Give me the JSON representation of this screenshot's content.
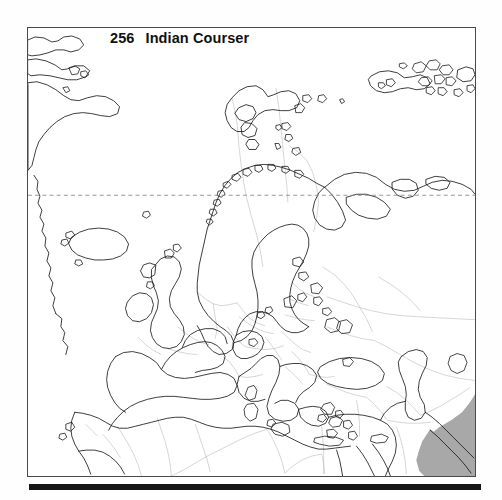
{
  "page": {
    "background_color": "#fefefe",
    "type": "field-guide-distribution-map"
  },
  "title": {
    "plate_number": "256",
    "species_name": "Indian Courser"
  },
  "map": {
    "frame": {
      "border_color": "#4a4a4a",
      "fill_color": "#ffffff"
    },
    "colors": {
      "coastline": "#1b1b1b",
      "country_border": "#b9b9b9",
      "range_shading": "#a8a8a8",
      "graticule": "#8d8d8d"
    },
    "graticule": {
      "label": "arctic-circle-dashed-line",
      "style": "dashed"
    },
    "range_legend": {
      "label": "resident-range",
      "color": "#a8a8a8"
    },
    "regions_shown": [
      "Greenland",
      "Iceland",
      "Scandinavia",
      "British Isles",
      "Europe",
      "Mediterranean",
      "North Africa",
      "Middle East",
      "Arabian Peninsula",
      "Caspian Sea",
      "Black Sea"
    ]
  },
  "bottom_rule": {
    "color": "#161616"
  }
}
